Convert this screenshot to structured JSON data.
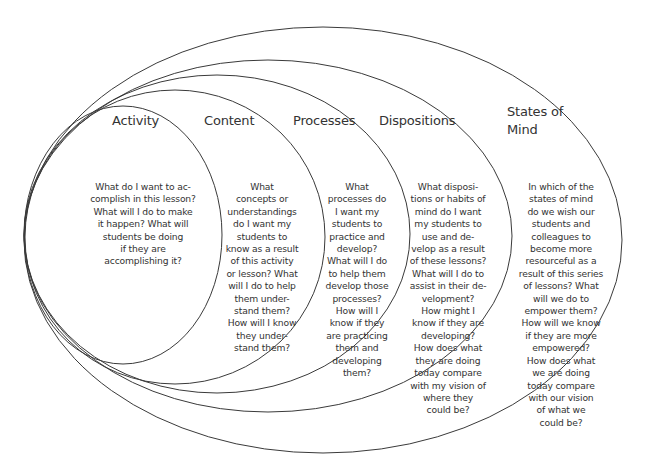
{
  "diagram": {
    "type": "nested-ellipses",
    "stroke_color": "#3a3a3a",
    "layers": [
      {
        "title": "Activity",
        "text": "What do I want to ac-\ncomplish in this lesson?\nWhat will I do to make\nit happen? What will\nstudents be doing\nif they are\naccomplishing it?",
        "ellipse": {
          "cx": 123,
          "cy": 235,
          "rx": 99,
          "ry": 129
        }
      },
      {
        "title": "Content",
        "text": "What\nconcepts or\nunderstandings\ndo I want my\nstudents to\nknow as a result\nof this activity\nor lesson? What\nwill I do to help\nthem under-\nstand them?\nHow will I know\nthey under-\nstand them?",
        "ellipse": {
          "cx": 175,
          "cy": 237,
          "rx": 150,
          "ry": 147
        }
      },
      {
        "title": "Processes",
        "text": "What\nprocesses do\nI want my\nstudents to\npractice and\ndevelop?\nWhat will I do\nto help them\ndevelop those\nprocesses?\nHow will I\nknow if they\nare practicing\nthem and\ndeveloping\nthem?",
        "ellipse": {
          "cx": 217,
          "cy": 234,
          "rx": 193,
          "ry": 159
        }
      },
      {
        "title": "Dispositions",
        "text": "What disposi-\ntions or habits of\nmind do I want\nmy students to\nuse and de-\nvelop as a result\nof these lessons?\nWhat will I do to\nassist in their de-\nvelopment?\nHow might I\nknow if they are\ndeveloping?\nHow does what\nthey are doing\ntoday compare\nwith my vision of\nwhere they\ncould be?",
        "ellipse": {
          "cx": 268,
          "cy": 236,
          "rx": 244,
          "ry": 176
        }
      },
      {
        "title": "States of Mind",
        "text": "In which of the\nstates of mind\ndo we wish our\nstudents and\ncolleagues to\nbecome more\nresourceful as a\nresult of this series\nof lessons? What\nwill we do to\nempower them?\nHow will we know\nif they are more\nempowered?\nHow does what\nwe are doing\ntoday compare\nwith our vision\nof what we\ncould be?",
        "ellipse": {
          "cx": 323,
          "cy": 240,
          "rx": 299,
          "ry": 213
        }
      }
    ]
  }
}
